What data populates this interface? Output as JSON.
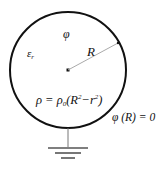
{
  "diagram": {
    "labels": {
      "phi": "φ",
      "epsilon": "ε",
      "epsilon_sub": "r",
      "radius": "R",
      "rho_lhs": "ρ = ρ",
      "rho_sub": "0",
      "rho_paren_open": "(R",
      "rho_sup1": "2",
      "rho_minus": "−r",
      "rho_sup2": "2",
      "rho_paren_close": ")",
      "boundary": "φ (R) = 0"
    },
    "colors": {
      "stroke": "#111111",
      "radius_line": "#999999",
      "ground": "#555555"
    }
  }
}
